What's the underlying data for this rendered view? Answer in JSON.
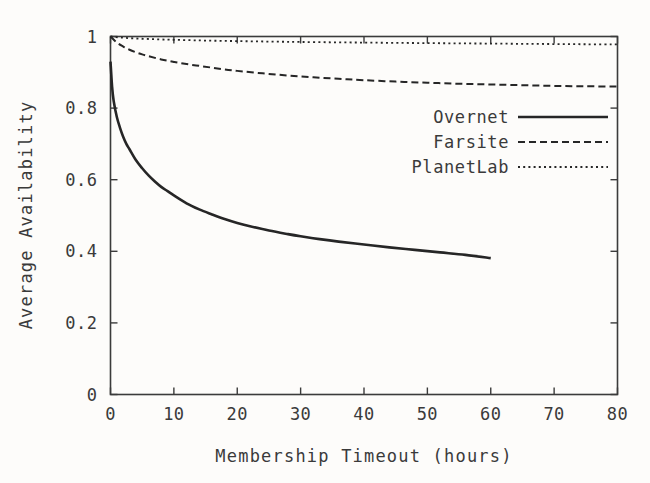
{
  "figure": {
    "background_color": "#fdfcfa",
    "ink_color": "#262626"
  },
  "chart_data": {
    "type": "line",
    "title": "",
    "xlabel": "Membership Timeout (hours)",
    "ylabel": "Average Availability",
    "xlim": [
      0,
      80
    ],
    "ylim": [
      0,
      1
    ],
    "xticks": [
      0,
      10,
      20,
      30,
      40,
      50,
      60,
      70,
      80
    ],
    "xtick_labels": [
      "0",
      "10",
      "20",
      "30",
      "40",
      "50",
      "60",
      "70",
      "80"
    ],
    "yticks": [
      0,
      0.2,
      0.4,
      0.6,
      0.8,
      1
    ],
    "ytick_labels": [
      "0",
      "0.2",
      "0.4",
      "0.6",
      "0.8",
      "1"
    ],
    "grid": false,
    "legend_position": "upper right",
    "series": [
      {
        "name": "Overnet",
        "style": "solid",
        "x": [
          0,
          0.25,
          0.5,
          1,
          1.5,
          2,
          2.5,
          3,
          4,
          5,
          6,
          7,
          8,
          9,
          10,
          12,
          14,
          16,
          18,
          20,
          22,
          25,
          28,
          30,
          33,
          36,
          40,
          44,
          48,
          52,
          56,
          60
        ],
        "values": [
          0.93,
          0.86,
          0.82,
          0.775,
          0.745,
          0.72,
          0.7,
          0.685,
          0.655,
          0.632,
          0.612,
          0.595,
          0.58,
          0.568,
          0.556,
          0.534,
          0.517,
          0.503,
          0.49,
          0.479,
          0.47,
          0.458,
          0.448,
          0.442,
          0.434,
          0.427,
          0.419,
          0.411,
          0.404,
          0.397,
          0.39,
          0.381
        ]
      },
      {
        "name": "Farsite",
        "style": "dashed",
        "x": [
          0,
          1,
          2,
          3,
          4,
          5,
          6,
          8,
          10,
          12,
          14,
          16,
          18,
          20,
          24,
          28,
          32,
          36,
          40,
          45,
          50,
          55,
          60,
          65,
          70,
          75,
          80
        ],
        "values": [
          1.0,
          0.983,
          0.972,
          0.963,
          0.956,
          0.95,
          0.945,
          0.936,
          0.929,
          0.923,
          0.918,
          0.913,
          0.908,
          0.904,
          0.897,
          0.891,
          0.886,
          0.882,
          0.878,
          0.874,
          0.871,
          0.868,
          0.866,
          0.864,
          0.862,
          0.861,
          0.86
        ]
      },
      {
        "name": "PlanetLab",
        "style": "dotted",
        "x": [
          0,
          2,
          4,
          6,
          8,
          10,
          14,
          18,
          22,
          26,
          30,
          35,
          40,
          45,
          50,
          55,
          60,
          65,
          70,
          75,
          80
        ],
        "values": [
          1.0,
          0.9965,
          0.9945,
          0.993,
          0.9918,
          0.9908,
          0.989,
          0.9877,
          0.9866,
          0.9856,
          0.9847,
          0.9838,
          0.983,
          0.9822,
          0.9815,
          0.9808,
          0.9802,
          0.9795,
          0.9789,
          0.9783,
          0.9778
        ]
      }
    ]
  },
  "legend": {
    "entries": [
      {
        "label": "Overnet",
        "style": "solid"
      },
      {
        "label": "Farsite",
        "style": "dashed"
      },
      {
        "label": "PlanetLab",
        "style": "dotted"
      }
    ]
  }
}
